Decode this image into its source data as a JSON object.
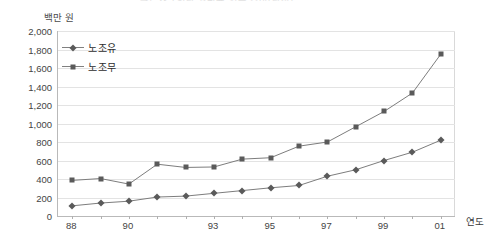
{
  "chart_title_clipped": "근로자 1인당 월평균 임금 추이(남성)",
  "axis": {
    "y_unit_label": "백만 원",
    "x_title": "연도",
    "y_ticks": [
      "2,000",
      "1,800",
      "1,600",
      "1,400",
      "1,200",
      "1,000",
      "800",
      "600",
      "400",
      "200",
      "0"
    ],
    "x_tick_labels": [
      "88",
      "",
      "90",
      "",
      "",
      "93",
      "",
      "95",
      "",
      "97",
      "",
      "99",
      "",
      "01"
    ]
  },
  "legend": {
    "items": [
      {
        "label": "노조유",
        "marker": "diamond-marker",
        "color": "#5a5a5a"
      },
      {
        "label": "노조무",
        "marker": "square-marker",
        "color": "#5a5a5a"
      }
    ]
  },
  "chart_data": {
    "type": "line",
    "title": "근로자 1인당 월평균 임금 추이(남성)",
    "xlabel": "연도",
    "ylabel": "백만 원",
    "ylim": [
      0,
      2000
    ],
    "ytick_step": 200,
    "grid": true,
    "legend_position": "top-left-inside",
    "categories": [
      "88",
      "89",
      "90",
      "91",
      "92",
      "93",
      "94",
      "95",
      "96",
      "97",
      "98",
      "99",
      "00",
      "01"
    ],
    "series": [
      {
        "name": "노조유",
        "marker": "diamond",
        "values": [
          110,
          140,
          160,
          205,
          215,
          245,
          275,
          305,
          330,
          430,
          500,
          600,
          690,
          820
        ]
      },
      {
        "name": "노조무",
        "marker": "square",
        "values": [
          385,
          405,
          345,
          560,
          525,
          530,
          615,
          630,
          755,
          800,
          965,
          1130,
          1330,
          1750
        ]
      }
    ]
  },
  "colors": {
    "line": "#7d7d7d",
    "marker": "#5a5a5a",
    "grid": "#e3e3e3",
    "axis": "#b9b9b9",
    "text": "#3a3a3a",
    "background": "#ffffff"
  }
}
